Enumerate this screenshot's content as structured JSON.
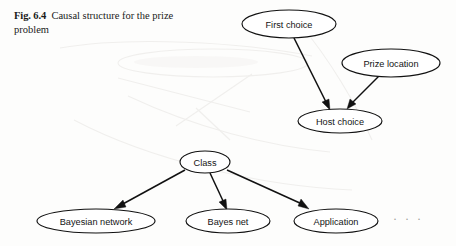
{
  "figure": {
    "label": "Fig. 6.4",
    "caption": "Causal structure for the prize problem"
  },
  "graphs": [
    {
      "name": "prize-problem-causal-graph",
      "nodes": [
        {
          "id": "first-choice",
          "label": "First choice",
          "cx": 289,
          "cy": 24,
          "rx": 47,
          "ry": 14
        },
        {
          "id": "prize-location",
          "label": "Prize location",
          "cx": 391,
          "cy": 63,
          "rx": 49,
          "ry": 14
        },
        {
          "id": "host-choice",
          "label": "Host choice",
          "cx": 340,
          "cy": 121,
          "rx": 42,
          "ry": 12
        }
      ],
      "edges": [
        {
          "from": "first-choice",
          "to": "host-choice"
        },
        {
          "from": "prize-location",
          "to": "host-choice"
        }
      ]
    },
    {
      "name": "class-subtype-graph",
      "nodes": [
        {
          "id": "class",
          "label": "Class",
          "cx": 205,
          "cy": 162,
          "rx": 25,
          "ry": 11
        },
        {
          "id": "bayesian-network",
          "label": "Bayesian network",
          "cx": 96,
          "cy": 221,
          "rx": 59,
          "ry": 12
        },
        {
          "id": "bayes-net",
          "label": "Bayes net",
          "cx": 228,
          "cy": 221,
          "rx": 42,
          "ry": 12
        },
        {
          "id": "application",
          "label": "Application",
          "cx": 336,
          "cy": 221,
          "rx": 42,
          "ry": 12
        }
      ],
      "edges": [
        {
          "from": "class",
          "to": "bayesian-network"
        },
        {
          "from": "class",
          "to": "bayes-net"
        },
        {
          "from": "class",
          "to": "application"
        }
      ],
      "more_indicator": "· · ·"
    }
  ],
  "colors": {
    "ink": "#111111",
    "paper": "#fdfdfc",
    "bleed": "#f0efed",
    "faint_text": "#9a9a98"
  }
}
